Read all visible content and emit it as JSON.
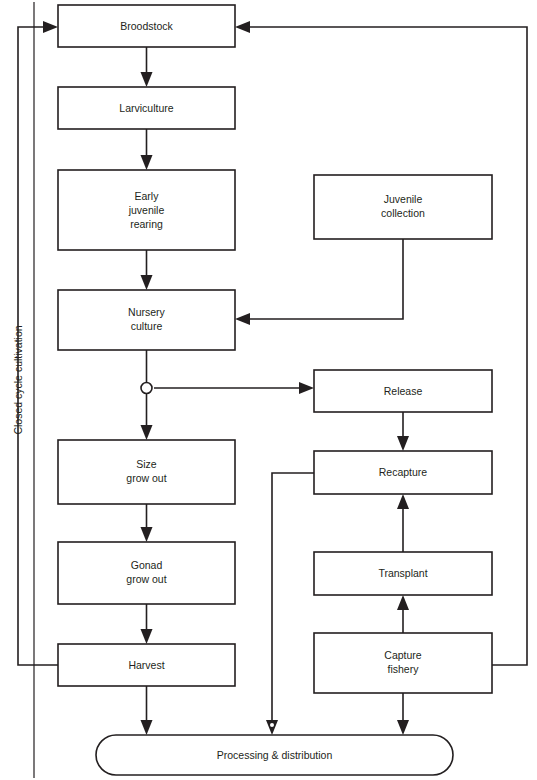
{
  "diagram": {
    "side_label": "Closed cycle cultivation",
    "colors": {
      "stroke": "#231f20",
      "fill": "#ffffff",
      "background": "#ffffff"
    },
    "nodes": [
      {
        "id": "broodstock",
        "label": "Broodstock",
        "lines": [
          "Broodstock"
        ],
        "shape": "rect",
        "x": 58,
        "y": 5,
        "w": 177,
        "h": 42
      },
      {
        "id": "larviculture",
        "label": "Larviculture",
        "lines": [
          "Larviculture"
        ],
        "shape": "rect",
        "x": 58,
        "y": 87,
        "w": 177,
        "h": 42
      },
      {
        "id": "early-juvenile-rearing",
        "label": "Early juvenile rearing",
        "lines": [
          "Early",
          "juvenile",
          "rearing"
        ],
        "shape": "rect",
        "x": 58,
        "y": 170,
        "w": 177,
        "h": 80
      },
      {
        "id": "nursery-culture",
        "label": "Nursery culture",
        "lines": [
          "Nursery",
          "culture"
        ],
        "shape": "rect",
        "x": 58,
        "y": 290,
        "w": 177,
        "h": 60
      },
      {
        "id": "size-grow-out",
        "label": "Size grow out",
        "lines": [
          "Size",
          "grow out"
        ],
        "shape": "rect",
        "x": 58,
        "y": 440,
        "w": 177,
        "h": 64
      },
      {
        "id": "gonad-grow-out",
        "label": "Gonad grow out",
        "lines": [
          "Gonad",
          "grow out"
        ],
        "shape": "rect",
        "x": 58,
        "y": 542,
        "w": 177,
        "h": 62
      },
      {
        "id": "harvest",
        "label": "Harvest",
        "lines": [
          "Harvest"
        ],
        "shape": "rect",
        "x": 58,
        "y": 644,
        "w": 177,
        "h": 42
      },
      {
        "id": "juvenile-collection",
        "label": "Juvenile collection",
        "lines": [
          "Juvenile",
          "collection"
        ],
        "shape": "rect",
        "x": 314,
        "y": 175,
        "w": 178,
        "h": 64
      },
      {
        "id": "release",
        "label": "Release",
        "lines": [
          "Release"
        ],
        "shape": "rect",
        "x": 314,
        "y": 370,
        "w": 178,
        "h": 42
      },
      {
        "id": "recapture",
        "label": "Recapture",
        "lines": [
          "Recapture"
        ],
        "shape": "rect",
        "x": 314,
        "y": 451,
        "w": 178,
        "h": 43
      },
      {
        "id": "transplant",
        "label": "Transplant",
        "lines": [
          "Transplant"
        ],
        "shape": "rect",
        "x": 314,
        "y": 552,
        "w": 178,
        "h": 43
      },
      {
        "id": "capture-fishery",
        "label": "Capture fishery",
        "lines": [
          "Capture",
          "fishery"
        ],
        "shape": "rect",
        "x": 314,
        "y": 633,
        "w": 178,
        "h": 60
      },
      {
        "id": "processing-distribution",
        "label": "Processing & distribution",
        "lines": [
          "Processing & distribution"
        ],
        "shape": "rounded",
        "x": 96,
        "y": 735,
        "w": 357,
        "h": 40
      }
    ],
    "edges": [
      {
        "from": "broodstock",
        "to": "larviculture",
        "kind": "vertical-arrow"
      },
      {
        "from": "larviculture",
        "to": "early-juvenile-rearing",
        "kind": "vertical-arrow"
      },
      {
        "from": "early-juvenile-rearing",
        "to": "nursery-culture",
        "kind": "vertical-arrow"
      },
      {
        "from": "nursery-culture",
        "to": "junction",
        "kind": "vertical-line"
      },
      {
        "from": "junction",
        "to": "size-grow-out",
        "kind": "vertical-arrow"
      },
      {
        "from": "junction",
        "to": "release",
        "kind": "horizontal-arrow"
      },
      {
        "from": "size-grow-out",
        "to": "gonad-grow-out",
        "kind": "vertical-arrow"
      },
      {
        "from": "gonad-grow-out",
        "to": "harvest",
        "kind": "vertical-arrow"
      },
      {
        "from": "harvest",
        "to": "processing-distribution",
        "kind": "vertical-arrow"
      },
      {
        "from": "harvest",
        "to": "broodstock",
        "kind": "left-loop"
      },
      {
        "from": "juvenile-collection",
        "to": "nursery-culture",
        "kind": "elbow-arrow"
      },
      {
        "from": "release",
        "to": "recapture",
        "kind": "vertical-arrow"
      },
      {
        "from": "recapture",
        "to": "processing-distribution",
        "kind": "left-elbow-arrow"
      },
      {
        "from": "transplant",
        "to": "recapture",
        "kind": "vertical-arrow-up"
      },
      {
        "from": "capture-fishery",
        "to": "transplant",
        "kind": "vertical-arrow-up"
      },
      {
        "from": "capture-fishery",
        "to": "processing-distribution",
        "kind": "vertical-arrow"
      },
      {
        "from": "capture-fishery",
        "to": "broodstock",
        "kind": "right-loop"
      }
    ]
  }
}
